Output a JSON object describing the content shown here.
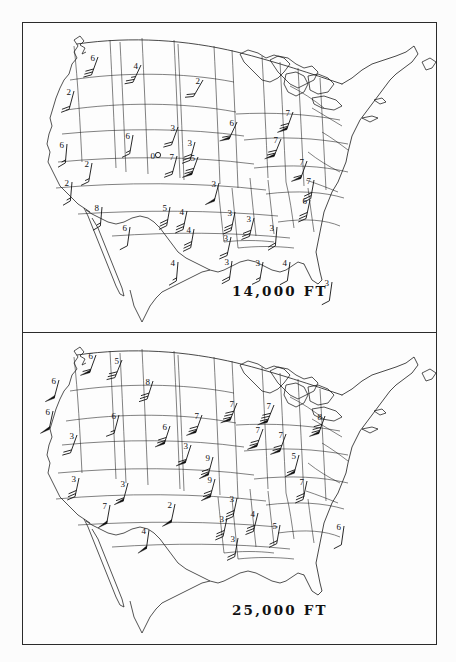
{
  "document": {
    "type": "upper-air-wind-chart-pair",
    "panels": [
      {
        "id": "panel-top",
        "altitude_label": "14,000 FT"
      },
      {
        "id": "panel-bottom",
        "altitude_label": "25,000 FT"
      }
    ]
  },
  "chart_data": {
    "type": "map",
    "symbols": {
      "flag": "filled triangular pennant (50 knots)",
      "full_barb": "long tick (10 knots)",
      "half_barb": "short tick (5 knots)",
      "circle": "open circle (calm)"
    },
    "panels": [
      {
        "altitude_label": "14,000 FT",
        "stations": [
          {
            "label": "6",
            "x": 76,
            "y": 35,
            "dir": 250,
            "flags": 0,
            "barbs": 3,
            "half": 0
          },
          {
            "label": "4",
            "x": 119,
            "y": 43,
            "dir": 245,
            "flags": 0,
            "barbs": 2,
            "half": 1
          },
          {
            "label": "2",
            "x": 181,
            "y": 58,
            "dir": 240,
            "flags": 0,
            "barbs": 2,
            "half": 0
          },
          {
            "label": "2",
            "x": 52,
            "y": 69,
            "dir": 255,
            "flags": 0,
            "barbs": 2,
            "half": 0
          },
          {
            "label": "6",
            "x": 45,
            "y": 122,
            "dir": 265,
            "flags": 0,
            "barbs": 1,
            "half": 1
          },
          {
            "label": "6",
            "x": 111,
            "y": 113,
            "dir": 260,
            "flags": 0,
            "barbs": 1,
            "half": 1
          },
          {
            "label": "3",
            "x": 156,
            "y": 105,
            "dir": 250,
            "flags": 0,
            "barbs": 2,
            "half": 0
          },
          {
            "label": "6",
            "x": 215,
            "y": 100,
            "dir": 245,
            "flags": 1,
            "barbs": 1,
            "half": 0
          },
          {
            "label": "7",
            "x": 271,
            "y": 90,
            "dir": 250,
            "flags": 1,
            "barbs": 2,
            "half": 0
          },
          {
            "label": "7",
            "x": 259,
            "y": 117,
            "dir": 248,
            "flags": 1,
            "barbs": 2,
            "half": 0
          },
          {
            "label": "5",
            "x": 176,
            "y": 135,
            "dir": 250,
            "flags": 1,
            "barbs": 2,
            "half": 0
          },
          {
            "label": "3",
            "x": 173,
            "y": 120,
            "dir": 255,
            "flags": 0,
            "barbs": 3,
            "half": 0
          },
          {
            "label": "2",
            "x": 70,
            "y": 141,
            "dir": 260,
            "flags": 0,
            "barbs": 1,
            "half": 1
          },
          {
            "label": "0",
            "x": 136,
            "y": 133,
            "dir": 0,
            "flags": 0,
            "barbs": 0,
            "half": 0,
            "calm": true
          },
          {
            "label": "7",
            "x": 155,
            "y": 134,
            "dir": 255,
            "flags": 0,
            "barbs": 2,
            "half": 0
          },
          {
            "label": "7",
            "x": 285,
            "y": 139,
            "dir": 250,
            "flags": 1,
            "barbs": 1,
            "half": 0
          },
          {
            "label": "3",
            "x": 197,
            "y": 161,
            "dir": 255,
            "flags": 1,
            "barbs": 0,
            "half": 0
          },
          {
            "label": "2",
            "x": 50,
            "y": 160,
            "dir": 265,
            "flags": 0,
            "barbs": 1,
            "half": 1
          },
          {
            "label": "7",
            "x": 292,
            "y": 158,
            "dir": 260,
            "flags": 0,
            "barbs": 3,
            "half": 0
          },
          {
            "label": "5",
            "x": 148,
            "y": 185,
            "dir": 260,
            "flags": 0,
            "barbs": 3,
            "half": 0
          },
          {
            "label": "4",
            "x": 165,
            "y": 189,
            "dir": 258,
            "flags": 0,
            "barbs": 3,
            "half": 0
          },
          {
            "label": "8",
            "x": 80,
            "y": 185,
            "dir": 265,
            "flags": 0,
            "barbs": 1,
            "half": 1
          },
          {
            "label": "6",
            "x": 108,
            "y": 205,
            "dir": 262,
            "flags": 0,
            "barbs": 1,
            "half": 0
          },
          {
            "label": "4",
            "x": 172,
            "y": 207,
            "dir": 260,
            "flags": 0,
            "barbs": 3,
            "half": 0
          },
          {
            "label": "3",
            "x": 213,
            "y": 190,
            "dir": 258,
            "flags": 0,
            "barbs": 3,
            "half": 0
          },
          {
            "label": "3",
            "x": 232,
            "y": 196,
            "dir": 256,
            "flags": 0,
            "barbs": 3,
            "half": 0
          },
          {
            "label": "6",
            "x": 288,
            "y": 178,
            "dir": 258,
            "flags": 0,
            "barbs": 3,
            "half": 0
          },
          {
            "label": "3",
            "x": 255,
            "y": 205,
            "dir": 265,
            "flags": 0,
            "barbs": 2,
            "half": 0
          },
          {
            "label": "3",
            "x": 209,
            "y": 215,
            "dir": 258,
            "flags": 0,
            "barbs": 2,
            "half": 0
          },
          {
            "label": "3",
            "x": 210,
            "y": 239,
            "dir": 262,
            "flags": 0,
            "barbs": 2,
            "half": 0
          },
          {
            "label": "3",
            "x": 241,
            "y": 240,
            "dir": 260,
            "flags": 0,
            "barbs": 1,
            "half": 1
          },
          {
            "label": "4",
            "x": 268,
            "y": 240,
            "dir": 262,
            "flags": 0,
            "barbs": 1,
            "half": 0
          },
          {
            "label": "4",
            "x": 156,
            "y": 240,
            "dir": 265,
            "flags": 0,
            "barbs": 1,
            "half": 1
          },
          {
            "label": "3",
            "x": 310,
            "y": 260,
            "dir": 262,
            "flags": 0,
            "barbs": 1,
            "half": 0
          }
        ]
      },
      {
        "altitude_label": "25,000 FT",
        "stations": [
          {
            "label": "6",
            "x": 74,
            "y": 22,
            "dir": 250,
            "flags": 1,
            "barbs": 1,
            "half": 0
          },
          {
            "label": "5",
            "x": 100,
            "y": 27,
            "dir": 248,
            "flags": 0,
            "barbs": 3,
            "half": 0
          },
          {
            "label": "8",
            "x": 131,
            "y": 48,
            "dir": 252,
            "flags": 0,
            "barbs": 3,
            "half": 0
          },
          {
            "label": "6",
            "x": 37,
            "y": 47,
            "dir": 255,
            "flags": 1,
            "barbs": 0,
            "half": 0
          },
          {
            "label": "6",
            "x": 31,
            "y": 78,
            "dir": 258,
            "flags": 1,
            "barbs": 0,
            "half": 0
          },
          {
            "label": "6",
            "x": 97,
            "y": 82,
            "dir": 255,
            "flags": 0,
            "barbs": 1,
            "half": 1
          },
          {
            "label": "3",
            "x": 55,
            "y": 102,
            "dir": 250,
            "flags": 0,
            "barbs": 2,
            "half": 0
          },
          {
            "label": "6",
            "x": 148,
            "y": 93,
            "dir": 252,
            "flags": 1,
            "barbs": 2,
            "half": 0
          },
          {
            "label": "7",
            "x": 180,
            "y": 82,
            "dir": 250,
            "flags": 1,
            "barbs": 2,
            "half": 0
          },
          {
            "label": "7",
            "x": 215,
            "y": 70,
            "dir": 248,
            "flags": 1,
            "barbs": 3,
            "half": 0
          },
          {
            "label": "7",
            "x": 252,
            "y": 72,
            "dir": 248,
            "flags": 1,
            "barbs": 3,
            "half": 0
          },
          {
            "label": "8",
            "x": 303,
            "y": 83,
            "dir": 250,
            "flags": 1,
            "barbs": 3,
            "half": 0
          },
          {
            "label": "7",
            "x": 241,
            "y": 96,
            "dir": 250,
            "flags": 1,
            "barbs": 2,
            "half": 0
          },
          {
            "label": "7",
            "x": 264,
            "y": 101,
            "dir": 250,
            "flags": 1,
            "barbs": 2,
            "half": 0
          },
          {
            "label": "9",
            "x": 191,
            "y": 124,
            "dir": 255,
            "flags": 1,
            "barbs": 2,
            "half": 0
          },
          {
            "label": "3",
            "x": 169,
            "y": 112,
            "dir": 252,
            "flags": 1,
            "barbs": 1,
            "half": 0
          },
          {
            "label": "9",
            "x": 193,
            "y": 146,
            "dir": 255,
            "flags": 1,
            "barbs": 2,
            "half": 0
          },
          {
            "label": "3",
            "x": 106,
            "y": 150,
            "dir": 255,
            "flags": 1,
            "barbs": 1,
            "half": 0
          },
          {
            "label": "3",
            "x": 57,
            "y": 145,
            "dir": 258,
            "flags": 0,
            "barbs": 3,
            "half": 0
          },
          {
            "label": "2",
            "x": 153,
            "y": 171,
            "dir": 258,
            "flags": 1,
            "barbs": 0,
            "half": 0
          },
          {
            "label": "7",
            "x": 88,
            "y": 172,
            "dir": 260,
            "flags": 1,
            "barbs": 0,
            "half": 0
          },
          {
            "label": "4",
            "x": 127,
            "y": 197,
            "dir": 262,
            "flags": 1,
            "barbs": 0,
            "half": 0
          },
          {
            "label": "3",
            "x": 215,
            "y": 165,
            "dir": 258,
            "flags": 0,
            "barbs": 3,
            "half": 0
          },
          {
            "label": "4",
            "x": 236,
            "y": 180,
            "dir": 256,
            "flags": 0,
            "barbs": 3,
            "half": 0
          },
          {
            "label": "3",
            "x": 205,
            "y": 185,
            "dir": 258,
            "flags": 0,
            "barbs": 3,
            "half": 0
          },
          {
            "label": "5",
            "x": 258,
            "y": 192,
            "dir": 260,
            "flags": 0,
            "barbs": 2,
            "half": 0
          },
          {
            "label": "3",
            "x": 216,
            "y": 205,
            "dir": 260,
            "flags": 0,
            "barbs": 2,
            "half": 0
          },
          {
            "label": "7",
            "x": 285,
            "y": 148,
            "dir": 258,
            "flags": 0,
            "barbs": 3,
            "half": 0
          },
          {
            "label": "6",
            "x": 322,
            "y": 193,
            "dir": 262,
            "flags": 0,
            "barbs": 1,
            "half": 0
          },
          {
            "label": "5",
            "x": 277,
            "y": 122,
            "dir": 255,
            "flags": 1,
            "barbs": 1,
            "half": 0
          }
        ]
      }
    ]
  }
}
